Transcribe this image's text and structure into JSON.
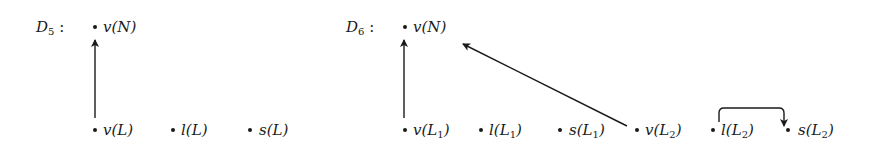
{
  "diagrams": [
    {
      "id": "D5",
      "title": {
        "base": "D",
        "sub": "5",
        "sep": " :"
      },
      "nodes": [
        {
          "id": "vN",
          "fn": "v(N",
          "sub": "",
          "close": ")",
          "x": 95,
          "y": 27
        },
        {
          "id": "vL",
          "fn": "v(L",
          "sub": "",
          "close": ")",
          "x": 95,
          "y": 130
        },
        {
          "id": "lL",
          "fn": "l(L",
          "sub": "",
          "close": ")",
          "x": 173,
          "y": 130
        },
        {
          "id": "sL",
          "fn": "s(L",
          "sub": "",
          "close": ")",
          "x": 250,
          "y": 130
        }
      ],
      "edges": [
        {
          "from": "vL",
          "to": "vN",
          "shape": "straight"
        }
      ]
    },
    {
      "id": "D6",
      "title": {
        "base": "D",
        "sub": "6",
        "sep": " :"
      },
      "nodes": [
        {
          "id": "vN",
          "fn": "v(N",
          "sub": "",
          "close": ")",
          "x": 405,
          "y": 27
        },
        {
          "id": "vL1",
          "fn": "v(L",
          "sub": "1",
          "close": ")",
          "x": 405,
          "y": 130
        },
        {
          "id": "lL1",
          "fn": "l(L",
          "sub": "1",
          "close": ")",
          "x": 481,
          "y": 130
        },
        {
          "id": "sL1",
          "fn": "s(L",
          "sub": "1",
          "close": ")",
          "x": 560,
          "y": 130
        },
        {
          "id": "vL2",
          "fn": "v(L",
          "sub": "2",
          "close": ")",
          "x": 637,
          "y": 130
        },
        {
          "id": "lL2",
          "fn": "l(L",
          "sub": "2",
          "close": ")",
          "x": 713,
          "y": 130
        },
        {
          "id": "sL2",
          "fn": "s(L",
          "sub": "2",
          "close": ")",
          "x": 788,
          "y": 130
        }
      ],
      "edges": [
        {
          "from": "vL1",
          "to": "vN",
          "shape": "straight"
        },
        {
          "from": "vL2",
          "to": "vN",
          "shape": "diagonal"
        },
        {
          "from": "lL2",
          "to": "sL2",
          "shape": "bracket-over"
        }
      ]
    }
  ]
}
